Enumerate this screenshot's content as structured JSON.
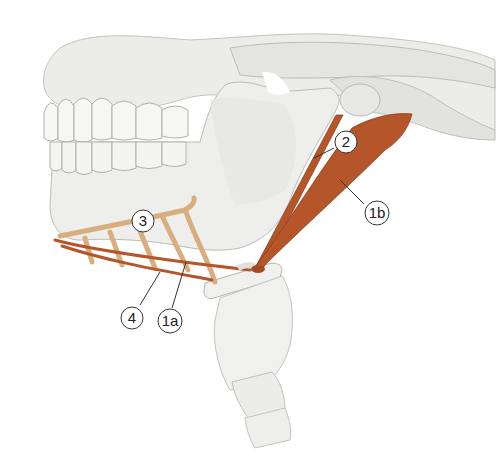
{
  "figure": {
    "colors": {
      "bone": "#ededeb",
      "bone_shadow": "#cfcfcb",
      "bone_outline": "#b8b8b2",
      "muscle": "#b5552a",
      "muscle_dark": "#8e3d1c",
      "muscle_light": "#d8ae7e",
      "label_stroke": "#333333"
    },
    "labels": [
      {
        "id": "2",
        "text": "2",
        "x": 344,
        "y": 142
      },
      {
        "id": "1b",
        "text": "1b",
        "x": 376,
        "y": 213
      },
      {
        "id": "3",
        "text": "3",
        "x": 140,
        "y": 218
      },
      {
        "id": "4",
        "text": "4",
        "x": 130,
        "y": 318
      },
      {
        "id": "1a",
        "text": "1a",
        "x": 169,
        "y": 322
      }
    ]
  }
}
